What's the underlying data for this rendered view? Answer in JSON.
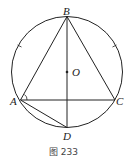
{
  "figure": {
    "caption": "图 233",
    "points": {
      "A": "A",
      "B": "B",
      "C": "C",
      "D": "D",
      "O": "O"
    },
    "segments": [
      "AB",
      "BC",
      "AC",
      "BD",
      "AD"
    ]
  }
}
